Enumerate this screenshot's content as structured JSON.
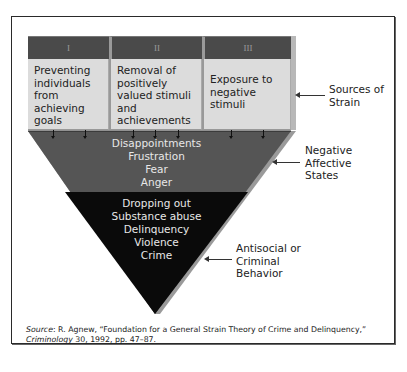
{
  "diagram": {
    "columns": [
      {
        "numeral": "I",
        "text": "Preventing individuals from achieving goals"
      },
      {
        "numeral": "II",
        "text": "Removal of positively valued stimuli and achievements"
      },
      {
        "numeral": "III",
        "text": "Exposure to negative stimuli"
      }
    ],
    "labels": {
      "sources": "Sources of Strain",
      "negative_affective": "Negative Affective States",
      "antisocial": "Antisocial or Criminal Behavior"
    },
    "negative_states": [
      "Disappointments",
      "Frustration",
      "Fear",
      "Anger"
    ],
    "behaviors": [
      "Dropping out",
      "Substance abuse",
      "Delinquency",
      "Violence",
      "Crime"
    ],
    "colors": {
      "header_bar": "#4a4a4a",
      "cell_bg": "#dcdcdc",
      "trapezoid": "#555555",
      "triangle": "#0a0a0a",
      "bevel": "#9a9a9a"
    }
  },
  "source": {
    "label": "Source",
    "text": ": R. Agnew, “Foundation for a General Strain Theory of Crime and Delinquency,”",
    "journal": "Criminology",
    "citation": " 30, 1992, pp. 47–87."
  }
}
